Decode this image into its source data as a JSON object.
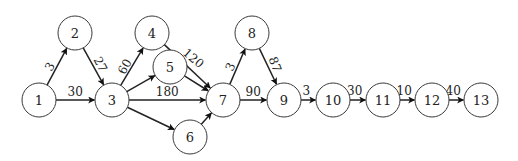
{
  "diagram": {
    "type": "directed-network",
    "nodes": [
      {
        "id": "1",
        "label": "1"
      },
      {
        "id": "2",
        "label": "2"
      },
      {
        "id": "3",
        "label": "3"
      },
      {
        "id": "4",
        "label": "4"
      },
      {
        "id": "5",
        "label": "5"
      },
      {
        "id": "6",
        "label": "6"
      },
      {
        "id": "7",
        "label": "7"
      },
      {
        "id": "8",
        "label": "8"
      },
      {
        "id": "9",
        "label": "9"
      },
      {
        "id": "10",
        "label": "10"
      },
      {
        "id": "11",
        "label": "11"
      },
      {
        "id": "12",
        "label": "12"
      },
      {
        "id": "13",
        "label": "13"
      }
    ],
    "edges": [
      {
        "from": "1",
        "to": "2",
        "label": "3"
      },
      {
        "from": "1",
        "to": "3",
        "label": "30"
      },
      {
        "from": "2",
        "to": "3",
        "label": "27"
      },
      {
        "from": "3",
        "to": "4",
        "label": "60"
      },
      {
        "from": "3",
        "to": "5",
        "label": ""
      },
      {
        "from": "3",
        "to": "7",
        "label": "180"
      },
      {
        "from": "3",
        "to": "6",
        "label": ""
      },
      {
        "from": "4",
        "to": "7",
        "label": "120"
      },
      {
        "from": "5",
        "to": "7",
        "label": ""
      },
      {
        "from": "6",
        "to": "7",
        "label": ""
      },
      {
        "from": "7",
        "to": "8",
        "label": "3"
      },
      {
        "from": "7",
        "to": "9",
        "label": "90"
      },
      {
        "from": "8",
        "to": "9",
        "label": "87"
      },
      {
        "from": "9",
        "to": "10",
        "label": "3"
      },
      {
        "from": "10",
        "to": "11",
        "label": "30"
      },
      {
        "from": "11",
        "to": "12",
        "label": "10"
      },
      {
        "from": "12",
        "to": "13",
        "label": "40"
      }
    ]
  }
}
